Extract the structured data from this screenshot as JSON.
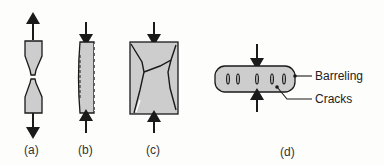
{
  "figure": {
    "panels": [
      {
        "id": "a",
        "label": "(a)",
        "description": "tension specimen necking and fracturing"
      },
      {
        "id": "b",
        "label": "(b)",
        "description": "compression specimen with surface cracks"
      },
      {
        "id": "c",
        "label": "(c)",
        "description": "compression specimen with shear fracture"
      },
      {
        "id": "d",
        "label": "(d)",
        "description": "barreled specimen with cracks"
      }
    ],
    "callouts": {
      "barreling": "Barreling",
      "cracks": "Cracks"
    },
    "colors": {
      "fill": "#cdcdcd",
      "stroke": "#1a1a1a"
    }
  }
}
